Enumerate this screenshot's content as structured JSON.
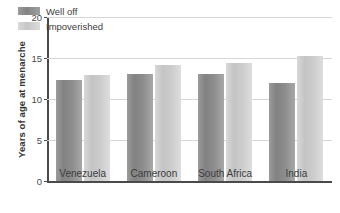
{
  "chart_data": {
    "type": "bar",
    "title": "",
    "subtitle": "",
    "xlabel": "",
    "ylabel": "Years of age at menarche",
    "categories": [
      "Venezuela",
      "Cameroon",
      "South Africa",
      "India"
    ],
    "series": [
      {
        "name": "Well off",
        "color": "#8d8d8d",
        "values": [
          12.3,
          13.1,
          13.1,
          11.9
        ]
      },
      {
        "name": "Impoverished",
        "color": "#cdcdcd",
        "values": [
          12.9,
          14.2,
          14.4,
          15.2
        ]
      }
    ],
    "ylim": [
      0,
      20
    ],
    "yticks": [
      0,
      5,
      10,
      15,
      20
    ],
    "ytick_labels": [
      "0",
      "5",
      "10",
      "15",
      "20"
    ],
    "grid": true,
    "grid_axis": "y",
    "legend_position": "upper left",
    "annotations": []
  }
}
